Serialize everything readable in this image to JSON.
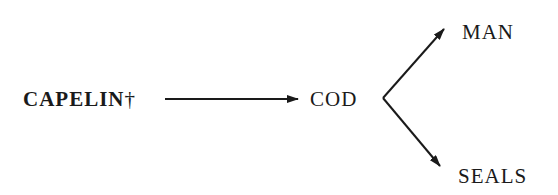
{
  "diagram": {
    "type": "food-chain",
    "nodes": {
      "capelin": {
        "label": "CAPELIN",
        "mark": "†",
        "bold": true
      },
      "cod": {
        "label": "COD"
      },
      "man": {
        "label": "MAN"
      },
      "seals": {
        "label": "SEALS"
      }
    },
    "edges": [
      {
        "from": "CAPELIN",
        "to": "COD"
      },
      {
        "from": "COD",
        "to": "MAN"
      },
      {
        "from": "COD",
        "to": "SEALS"
      }
    ],
    "colors": {
      "ink": "#1a1a1a",
      "background": "#ffffff"
    }
  }
}
